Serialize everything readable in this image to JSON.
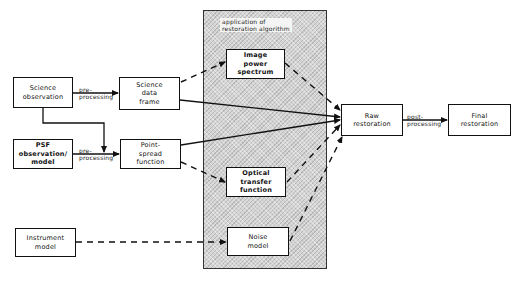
{
  "diagram": {
    "panel": {
      "label": "application of\nrestoration algorithm"
    },
    "nodes": {
      "science_observation": "Science\nobservation",
      "science_data_frame": "Science\ndata\nframe",
      "psf_observation": "PSF\nobservation/\nmodel",
      "point_spread_function": "Point-\nspread\nfunction",
      "instrument_model": "Instrument\nmodel",
      "image_power_spectrum": "Image\npower\nspectrum",
      "optical_transfer_function": "Optical\ntransfer\nfunction",
      "noise_model": "Noise\nmodel",
      "raw_restoration": "Raw\nrestoration",
      "final_restoration": "Final\nrestoration"
    },
    "edge_labels": {
      "pre_processing_1": "pre-\nprocessing",
      "pre_processing_2": "pre-\nprocessing",
      "post_processing": "post-\nprocessing"
    },
    "colors": {
      "line": "#111111",
      "panel_fill": "#d4d4d4",
      "box_fill": "#ffffff"
    }
  }
}
